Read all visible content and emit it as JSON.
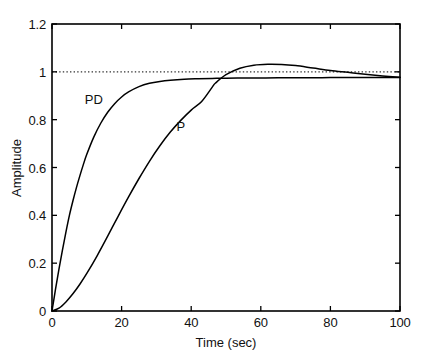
{
  "chart_data": {
    "type": "line",
    "title": "",
    "xlabel": "Time (sec)",
    "ylabel": "Amplitude",
    "xlim": [
      0,
      100
    ],
    "ylim": [
      0,
      1.2
    ],
    "xticks": [
      0,
      20,
      40,
      60,
      80,
      100
    ],
    "xtick_labels": [
      "0",
      "20",
      "40",
      "60",
      "80",
      "100"
    ],
    "yticks": [
      0,
      0.2,
      0.4,
      0.6,
      0.8,
      1,
      1.2
    ],
    "ytick_labels": [
      "0",
      "0.2",
      "0.4",
      "0.6",
      "0.8",
      "1",
      "1.2"
    ],
    "grid": false,
    "legend_position": "inline-annotations",
    "line_color": "#000000",
    "reference_line": {
      "name": "steady-state-reference",
      "y": 1.0,
      "style": "dotted",
      "color": "#333333"
    },
    "annotations": [
      {
        "name": "PD",
        "text": "PD",
        "x": 12,
        "y": 0.885
      },
      {
        "name": "P",
        "text": "P",
        "x": 37,
        "y": 0.775
      }
    ],
    "series": [
      {
        "name": "PD",
        "label": "PD",
        "x": [
          0,
          1,
          2,
          3,
          4,
          5,
          6,
          7,
          8,
          9,
          10,
          12,
          14,
          16,
          18,
          20,
          22,
          25,
          28,
          31,
          34,
          38,
          42,
          46,
          50,
          55,
          60,
          65,
          70,
          75,
          80,
          85,
          90,
          95,
          100
        ],
        "values": [
          0,
          0.09,
          0.175,
          0.255,
          0.33,
          0.4,
          0.46,
          0.515,
          0.565,
          0.612,
          0.655,
          0.727,
          0.785,
          0.831,
          0.867,
          0.895,
          0.916,
          0.938,
          0.952,
          0.96,
          0.965,
          0.969,
          0.971,
          0.9725,
          0.9735,
          0.974,
          0.9745,
          0.975,
          0.9752,
          0.9755,
          0.9758,
          0.976,
          0.9762,
          0.9764,
          0.9766
        ]
      },
      {
        "name": "P",
        "label": "P",
        "x": [
          0,
          2,
          4,
          6,
          8,
          10,
          13,
          16,
          19,
          22,
          25,
          28,
          31,
          34,
          37,
          40,
          43,
          46,
          47,
          50,
          54,
          58,
          62,
          66,
          70,
          75,
          80,
          85,
          90,
          95,
          100
        ],
        "values": [
          0,
          0.012,
          0.038,
          0.072,
          0.112,
          0.157,
          0.232,
          0.313,
          0.396,
          0.477,
          0.554,
          0.626,
          0.691,
          0.748,
          0.797,
          0.84,
          0.876,
          0.935,
          0.953,
          0.988,
          1.015,
          1.028,
          1.032,
          1.031,
          1.026,
          1.016,
          1.006,
          0.998,
          0.99,
          0.983,
          0.977
        ]
      }
    ]
  },
  "axes": {
    "box": {
      "left": 52,
      "top": 24,
      "right": 400,
      "bottom": 311
    }
  }
}
